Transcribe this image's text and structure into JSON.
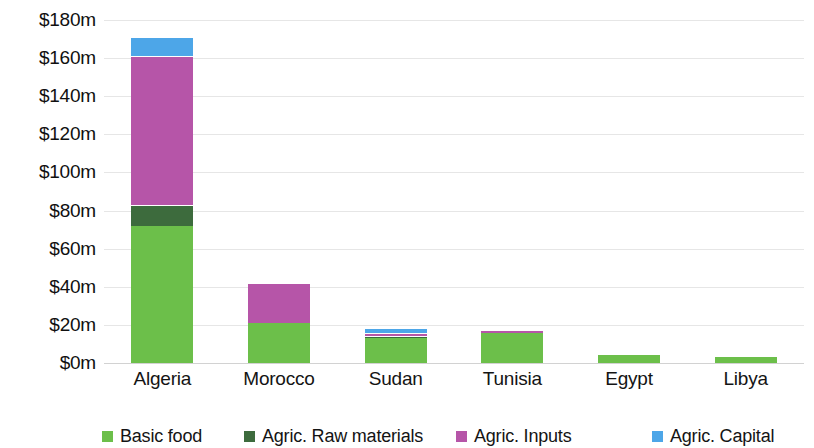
{
  "chart_data": {
    "type": "bar",
    "subtype": "stacked-bar",
    "title": "",
    "xlabel": "",
    "ylabel": "",
    "categories": [
      "Algeria",
      "Morocco",
      "Sudan",
      "Tunisia",
      "Egypt",
      "Libya"
    ],
    "series": [
      {
        "name": "Basic food",
        "color": "#6cbf4a",
        "values": [
          72,
          21,
          13,
          15.5,
          4,
          3
        ]
      },
      {
        "name": "Agric. Raw materials",
        "color": "#3d6b3d",
        "values": [
          11,
          0,
          1.3,
          0,
          0,
          0
        ]
      },
      {
        "name": "Agric. Inputs",
        "color": "#b655a8",
        "values": [
          78,
          21,
          1.7,
          2,
          0,
          0
        ]
      },
      {
        "name": "Agric. Capital",
        "color": "#4da6e8",
        "values": [
          10,
          0,
          2.5,
          0,
          0,
          0
        ]
      }
    ],
    "totals": [
      171,
      42,
      18.5,
      17.5,
      4,
      3
    ],
    "ylim": [
      0,
      180
    ],
    "y_ticks": [
      0,
      20,
      40,
      60,
      80,
      100,
      120,
      140,
      160,
      180
    ],
    "y_tick_labels": [
      "$0m",
      "$20m",
      "$40m",
      "$60m",
      "$80m",
      "$100m",
      "$120m",
      "$140m",
      "$160m",
      "$180m"
    ],
    "grid": true,
    "legend_position": "bottom",
    "units": "USD millions"
  },
  "legend": {
    "items": [
      {
        "label": "Basic food",
        "color": "#6cbf4a"
      },
      {
        "label": "Agric. Raw materials",
        "color": "#3d6b3d"
      },
      {
        "label": "Agric. Inputs",
        "color": "#b655a8"
      },
      {
        "label": "Agric. Capital",
        "color": "#4da6e8"
      }
    ]
  },
  "colors": {
    "gridline": "#e6e6e6",
    "baseline": "#d2d2d2",
    "background": "#ffffff",
    "text": "#141414"
  }
}
